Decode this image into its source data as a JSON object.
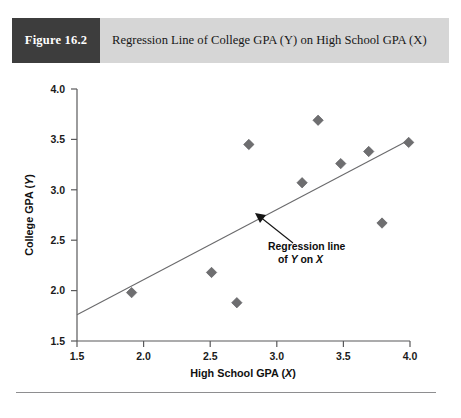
{
  "figure": {
    "number_label": "Figure 16.2",
    "caption": "Regression Line of College GPA (Y) on High School GPA (X)"
  },
  "colors": {
    "header_band": "#d6d6d6",
    "figure_block": "#3d3d3d",
    "marker": "#6e6e70",
    "axis": "#59595b",
    "regression_line": "#6a6a6c",
    "annotation": "#141414"
  },
  "annotation": {
    "line1": "Regression line",
    "line2_prefix": "of ",
    "line2_y": "Y",
    "line2_mid": " on ",
    "line2_x": "X"
  },
  "axes": {
    "x_title_text": "High School GPA (",
    "x_title_var": "X",
    "x_title_close": ")",
    "y_title_text": "College GPA (",
    "y_title_var": "Y",
    "y_title_close": ")"
  },
  "chart_data": {
    "type": "scatter",
    "title": "Regression Line of College GPA (Y) on High School GPA (X)",
    "xlabel": "High School GPA (X)",
    "ylabel": "College GPA (Y)",
    "xlim": [
      1.5,
      4.0
    ],
    "ylim": [
      1.5,
      4.0
    ],
    "xticks": [
      1.5,
      2.0,
      2.5,
      3.0,
      3.5,
      4.0
    ],
    "yticks": [
      1.5,
      2.0,
      2.5,
      3.0,
      3.5,
      4.0
    ],
    "xtick_labels": [
      "1.5",
      "2.0",
      "2.5",
      "3.0",
      "3.5",
      "4.0"
    ],
    "ytick_labels": [
      "1.5",
      "2.0",
      "2.5",
      "3.0",
      "3.5",
      "4.0"
    ],
    "grid": false,
    "legend": "none",
    "points": [
      {
        "x": 1.91,
        "y": 1.98
      },
      {
        "x": 2.51,
        "y": 2.18
      },
      {
        "x": 2.7,
        "y": 1.88
      },
      {
        "x": 2.79,
        "y": 3.45
      },
      {
        "x": 3.19,
        "y": 3.07
      },
      {
        "x": 3.31,
        "y": 3.69
      },
      {
        "x": 3.48,
        "y": 3.26
      },
      {
        "x": 3.69,
        "y": 3.38
      },
      {
        "x": 3.79,
        "y": 2.67
      },
      {
        "x": 3.99,
        "y": 3.47
      }
    ],
    "series": [
      {
        "name": "Regression line of Y on X",
        "type": "line",
        "endpoints": [
          {
            "x": 1.5,
            "y": 1.76
          },
          {
            "x": 4.0,
            "y": 3.5
          }
        ]
      }
    ],
    "annotations": [
      {
        "text": "Regression line of Y on X",
        "target": {
          "x": 2.85,
          "y": 2.73
        },
        "label_at": {
          "x": 2.95,
          "y": 2.45
        }
      }
    ]
  }
}
